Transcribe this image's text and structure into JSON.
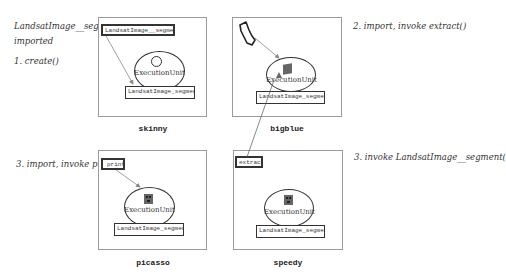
{
  "annotations": {
    "imported_line1": "LandsatImage__segment",
    "imported_line2": "imported",
    "step1": "1. create()",
    "step2": "2. import, invoke extract()",
    "step3_picasso": "3. import, invoke print()",
    "step3_speedy": "3. invoke LandsatImage__segment("
  },
  "hosts": [
    {
      "name": "skinny",
      "source_object": "LandsatImage__segment",
      "execution_unit": "ExecutionUnit",
      "eu_icon": "empty-circle",
      "segment": "LandsatImage_segment"
    },
    {
      "name": "bigblue",
      "source_object": "boot-shaped-object",
      "execution_unit": "ExecutionUnit",
      "eu_icon": "filled-square",
      "segment": "LandsatImage_segment"
    },
    {
      "name": "picasso",
      "source_object": "print",
      "execution_unit": "ExecutionUnit",
      "eu_icon": "face-square",
      "segment": "LandsatImage_segment"
    },
    {
      "name": "speedy",
      "source_object": "extract",
      "execution_unit": "ExecutionUnit",
      "eu_icon": "face-square",
      "segment": "LandsatImage_segment"
    }
  ],
  "colors": {
    "line": "#333333",
    "arrow": "#888888",
    "host_border": "#9a9a9a",
    "icon_fill": "#666666"
  }
}
